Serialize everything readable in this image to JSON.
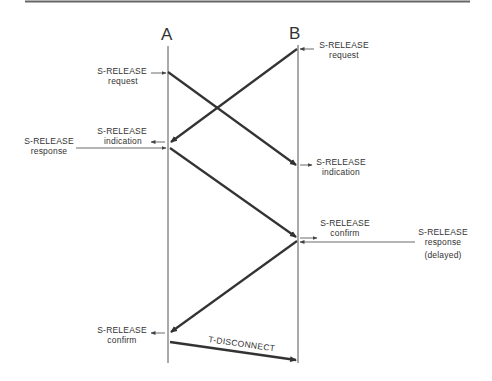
{
  "diagram": {
    "type": "time-sequence",
    "entities": [
      {
        "id": "A",
        "label": "A"
      },
      {
        "id": "B",
        "label": "B"
      }
    ],
    "labels": {
      "a_request": [
        "S-RELEASE",
        "request"
      ],
      "b_request": [
        "S-RELEASE",
        "request"
      ],
      "a_indication": [
        "S-RELEASE",
        "indication"
      ],
      "a_response": [
        "S-RELEASE",
        "response"
      ],
      "b_indication": [
        "S-RELEASE",
        "indication"
      ],
      "b_confirm": [
        "S-RELEASE",
        "confirm"
      ],
      "b_response": [
        "S-RELEASE",
        "response",
        "(delayed)"
      ],
      "a_confirm": [
        "S-RELEASE",
        "confirm"
      ],
      "t_disconnect": "T-DISCONNECT"
    },
    "messages": [
      {
        "from": "A",
        "to": "B",
        "start": "S-RELEASE request",
        "end": "S-RELEASE indication"
      },
      {
        "from": "B",
        "to": "A",
        "start": "S-RELEASE request",
        "end": "S-RELEASE indication"
      },
      {
        "from": "A",
        "to": "B",
        "start": "S-RELEASE response",
        "end": "S-RELEASE confirm"
      },
      {
        "from": "B",
        "to": "A",
        "start": "S-RELEASE response (delayed)",
        "end": "S-RELEASE confirm"
      },
      {
        "from": "A",
        "to": "B",
        "label": "T-DISCONNECT"
      }
    ],
    "colors": {
      "line": "#333333",
      "text": "#333333",
      "rule": "#666666"
    }
  }
}
